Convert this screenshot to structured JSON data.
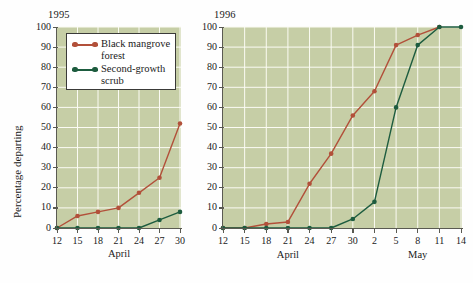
{
  "figure": {
    "ylabel": "Percentage departing",
    "series_colors": {
      "mangrove": "#b2503a",
      "scrub": "#1d5c3f"
    },
    "legend": {
      "entries": [
        {
          "label": "Black mangrove\nforest",
          "color_key": "mangrove"
        },
        {
          "label": "Second-growth\nscrub",
          "color_key": "scrub"
        }
      ]
    }
  },
  "chart_data": [
    {
      "type": "line",
      "title": "1995",
      "xlabel": "April",
      "ylabel": "Percentage departing",
      "ylim": [
        0,
        100
      ],
      "yticks": [
        0,
        10,
        20,
        30,
        40,
        50,
        60,
        70,
        80,
        90,
        100
      ],
      "categories": [
        "12",
        "15",
        "18",
        "21",
        "24",
        "27",
        "30"
      ],
      "months": [
        {
          "label": "April",
          "from": "12",
          "to": "30"
        }
      ],
      "grid": true,
      "legend_position": "upper-left-inside",
      "series": [
        {
          "name": "Black mangrove forest",
          "color": "#b2503a",
          "values": [
            0,
            6,
            8,
            10,
            17.5,
            25,
            52
          ]
        },
        {
          "name": "Second-growth scrub",
          "color": "#1d5c3f",
          "values": [
            0,
            0,
            0,
            0,
            0,
            4,
            8
          ]
        }
      ]
    },
    {
      "type": "line",
      "title": "1996",
      "xlabel": "",
      "ylabel": "Percentage departing",
      "ylim": [
        0,
        100
      ],
      "yticks": [
        0,
        10,
        20,
        30,
        40,
        50,
        60,
        70,
        80,
        90,
        100
      ],
      "categories": [
        "12",
        "15",
        "18",
        "21",
        "24",
        "27",
        "30",
        "2",
        "5",
        "8",
        "11",
        "14"
      ],
      "months": [
        {
          "label": "April",
          "from": "12",
          "to": "30"
        },
        {
          "label": "May",
          "from": "2",
          "to": "14"
        }
      ],
      "grid": true,
      "series": [
        {
          "name": "Black mangrove forest",
          "color": "#b2503a",
          "values": [
            0,
            0,
            2,
            3,
            22,
            37,
            56,
            68,
            91,
            96,
            100,
            null
          ]
        },
        {
          "name": "Second-growth scrub",
          "color": "#1d5c3f",
          "values": [
            0,
            0,
            0,
            0,
            0,
            0,
            4.5,
            13,
            60,
            91,
            100,
            100
          ]
        }
      ]
    }
  ]
}
